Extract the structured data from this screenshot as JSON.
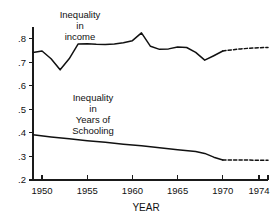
{
  "chart_data": {
    "type": "line",
    "title": "",
    "xlabel": "YEAR",
    "ylabel": "",
    "xlim": [
      1949,
      1975
    ],
    "ylim": [
      0.2,
      0.85
    ],
    "grid": false,
    "legend_position": "inline-annotations",
    "xticks": [
      1950,
      1955,
      1960,
      1965,
      1970,
      1974
    ],
    "xticklabels": [
      "1950",
      "1955",
      "1960",
      "1965",
      "1970",
      "1974"
    ],
    "yticks": [
      0.2,
      0.3,
      0.4,
      0.5,
      0.6,
      0.7,
      0.8
    ],
    "yticklabels": [
      ".2",
      ".3",
      ".4",
      ".5",
      ".6",
      ".7",
      ".8"
    ],
    "series": [
      {
        "name": "Inequality in income",
        "style": "solid",
        "x": [
          1949,
          1950,
          1951,
          1952,
          1953,
          1954,
          1955,
          1956,
          1957,
          1958,
          1959,
          1960,
          1961,
          1962,
          1963,
          1964,
          1965,
          1966,
          1967,
          1968,
          1969,
          1970
        ],
        "values": [
          0.742,
          0.748,
          0.715,
          0.668,
          0.715,
          0.778,
          0.779,
          0.777,
          0.776,
          0.778,
          0.783,
          0.792,
          0.825,
          0.768,
          0.755,
          0.757,
          0.765,
          0.763,
          0.742,
          0.709,
          0.728,
          0.748
        ]
      },
      {
        "name": "Inequality in income (projected)",
        "style": "dashed",
        "x": [
          1970,
          1971,
          1972,
          1973,
          1974,
          1975
        ],
        "values": [
          0.748,
          0.753,
          0.757,
          0.76,
          0.762,
          0.763
        ]
      },
      {
        "name": "Inequality in Years of Schooling",
        "style": "solid",
        "x": [
          1949,
          1951,
          1953,
          1955,
          1957,
          1959,
          1961,
          1963,
          1965,
          1967,
          1968,
          1969,
          1970
        ],
        "values": [
          0.392,
          0.383,
          0.375,
          0.367,
          0.36,
          0.352,
          0.345,
          0.337,
          0.329,
          0.321,
          0.313,
          0.297,
          0.285
        ]
      },
      {
        "name": "Inequality in Years of Schooling (projected)",
        "style": "dashed",
        "x": [
          1970,
          1972,
          1974,
          1975
        ],
        "values": [
          0.285,
          0.285,
          0.284,
          0.284
        ]
      }
    ],
    "annotations": [
      {
        "id": "income",
        "lines": [
          "Inequality",
          "in",
          "income"
        ],
        "text": "Inequality\nin\nincome"
      },
      {
        "id": "schooling",
        "lines": [
          "Inequality",
          "in",
          "Years of",
          "Schooling"
        ],
        "text": "Inequality\nin\nYears of\nSchooling"
      }
    ],
    "colors": {
      "line": "#111111",
      "axis": "#1a1a1a",
      "background": "#ffffff"
    }
  }
}
